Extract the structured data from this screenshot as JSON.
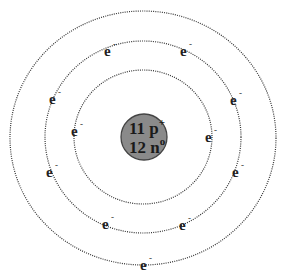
{
  "diagram": {
    "nucleus": {
      "protons_label": "11 p",
      "protons_charge": "+",
      "neutrons_label": "12 n",
      "neutrons_charge": "o",
      "fill": "#8a8a8a"
    },
    "electron_symbol": "e",
    "electron_charge": "-",
    "shells": [
      {
        "name": "shell-1",
        "electrons": 2
      },
      {
        "name": "shell-2",
        "electrons": 8
      },
      {
        "name": "shell-3",
        "electrons": 1
      }
    ]
  }
}
